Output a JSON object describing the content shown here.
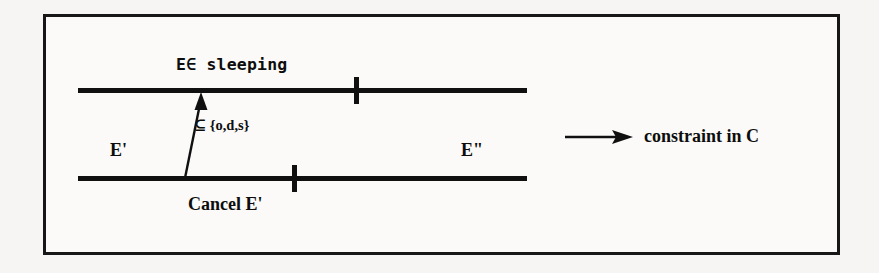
{
  "figure": {
    "background_color": "#f6f5f3",
    "ink_color": "#101010",
    "frame": {
      "stroke_color": "#171717",
      "stroke_width": 3
    }
  },
  "timelines": [
    {
      "id": "top",
      "entity_label": "",
      "above_label": "E∈ sleeping",
      "tick_count": 1
    },
    {
      "id": "bottom",
      "entity_label": "E'",
      "entity_label_right": "E\"",
      "below_label": "Cancel E'",
      "tick_count": 1
    }
  ],
  "labels": {
    "sleeping": "E∈ sleeping",
    "subset": "⊆ {o,d,s}",
    "e_prime": "E'",
    "e_double_prime": "E\"",
    "cancel": "Cancel E'"
  },
  "legend": {
    "arrow_icon": "right-arrow-icon",
    "text": "constraint in C"
  },
  "constraint_arrow": {
    "name": "constraint-arrow",
    "from": {
      "x": 185,
      "y": 178
    },
    "to": {
      "x": 201,
      "y": 93
    },
    "direction": "up",
    "annotation": "⊆ {o,d,s}"
  }
}
